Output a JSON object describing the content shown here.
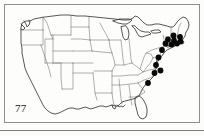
{
  "figure": {
    "plate_number": "77",
    "caption_text": "",
    "frame_color": "#8d8d8d",
    "background_color": "#fdfdfb",
    "outline_color": "#2d2d2d",
    "state_border_color": "#6e6e6e",
    "dot_color": "#080808",
    "map_region": "contiguous United States",
    "symbol_meaning": "collection record"
  },
  "chart_data": {
    "type": "scatter",
    "title": "77",
    "xlabel": "",
    "ylabel": "",
    "xlim": [
      0,
      196
    ],
    "ylim": [
      0,
      119
    ],
    "grid": false,
    "legend": "none",
    "series": [
      {
        "name": "records",
        "marker": "filled-circle",
        "color": "#080808",
        "radius": 2.9,
        "count": 14,
        "points": [
          {
            "x": 168.5,
            "y": 30.5,
            "label": "NH/ME border"
          },
          {
            "x": 175.0,
            "y": 32.0,
            "label": "southern ME"
          },
          {
            "x": 163.0,
            "y": 34.5,
            "label": "central MA"
          },
          {
            "x": 169.0,
            "y": 35.5,
            "label": "eastern MA"
          },
          {
            "x": 175.5,
            "y": 36.5,
            "label": "coastal MA"
          },
          {
            "x": 160.5,
            "y": 38.5,
            "label": "CT"
          },
          {
            "x": 166.5,
            "y": 39.5,
            "label": "RI"
          },
          {
            "x": 172.0,
            "y": 38.5,
            "label": "Cape Cod"
          },
          {
            "x": 157.0,
            "y": 45.0,
            "label": "NJ"
          },
          {
            "x": 153.5,
            "y": 52.5,
            "label": "DE/MD"
          },
          {
            "x": 151.0,
            "y": 60.0,
            "label": "VA tidewater"
          },
          {
            "x": 155.5,
            "y": 65.5,
            "label": "northeastern NC"
          },
          {
            "x": 149.5,
            "y": 68.0,
            "label": "central NC"
          },
          {
            "x": 143.0,
            "y": 78.0,
            "label": "SC coastal plain"
          }
        ]
      }
    ]
  },
  "map_geometry": {
    "national_outline_note": "continental US coastline and national borders",
    "interior_borders_note": "state boundary lines, dashed/thin"
  }
}
